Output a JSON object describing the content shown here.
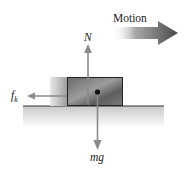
{
  "diagram": {
    "type": "free-body diagram",
    "labels": {
      "motion": "Motion",
      "normal_force": "N",
      "weight": "mg",
      "friction_main": "f",
      "friction_sub": "k"
    },
    "colors": {
      "arrow": "#8a8a8a",
      "block_dark": "#5a5a5a",
      "block_light": "#b0b0b0",
      "ground": "#d6d6d6",
      "motion_arrow_dark": "#555555",
      "text": "#222222"
    }
  }
}
